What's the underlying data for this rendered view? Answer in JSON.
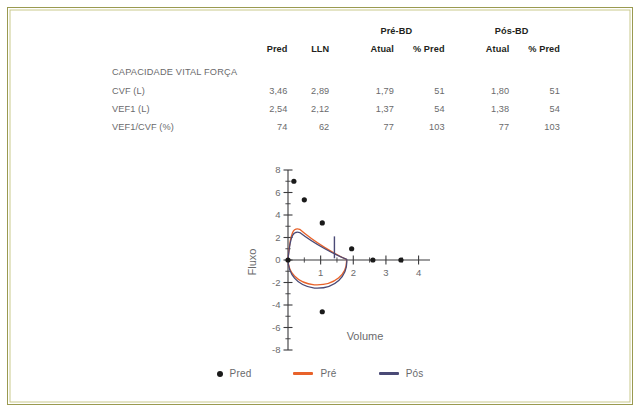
{
  "border_color": "#9a9a50",
  "table": {
    "group_headers": [
      {
        "label": "Pré-BD",
        "span": 2
      },
      {
        "label": "Pós-BD",
        "span": 2
      }
    ],
    "columns": [
      "Pred",
      "LLN",
      "Atual",
      "% Pred",
      "Atual",
      "% Pred"
    ],
    "section_label": "CAPACIDADE VITAL FORÇA",
    "rows": [
      {
        "label": "CVF (L)",
        "pred": "3,46",
        "lln": "2,89",
        "pre_atual": "1,79",
        "pre_pct": "51",
        "pos_atual": "1,80",
        "pos_pct": "51"
      },
      {
        "label": "VEF1 (L)",
        "pred": "2,54",
        "lln": "2,12",
        "pre_atual": "1,37",
        "pre_pct": "54",
        "pos_atual": "1,38",
        "pos_pct": "54"
      },
      {
        "label": "VEF1/CVF (%)",
        "pred": "74",
        "lln": "62",
        "pre_atual": "77",
        "pre_pct": "103",
        "pos_atual": "77",
        "pos_pct": "103"
      }
    ]
  },
  "chart_data": {
    "type": "line",
    "title": "",
    "xlabel": "Volume",
    "ylabel": "Fluxo",
    "xlim": [
      0,
      4.35
    ],
    "ylim": [
      -8,
      8
    ],
    "xticks": [
      1,
      2,
      3,
      4
    ],
    "yticks": [
      -8,
      -6,
      -4,
      -2,
      0,
      2,
      4,
      6,
      8
    ],
    "x_minor_step": 0.5,
    "y_minor_step": 1,
    "grid": false,
    "legend_position": "bottom",
    "series": [
      {
        "name": "Pred",
        "type": "scatter",
        "color": "#1a1a1a",
        "points": [
          {
            "x": 0.0,
            "y": 0.0
          },
          {
            "x": 0.18,
            "y": 7.0
          },
          {
            "x": 0.5,
            "y": 5.35
          },
          {
            "x": 1.05,
            "y": 3.3
          },
          {
            "x": 1.95,
            "y": 1.0
          },
          {
            "x": 2.6,
            "y": 0.0
          },
          {
            "x": 3.46,
            "y": 0.0
          },
          {
            "x": 1.05,
            "y": -4.6
          }
        ]
      },
      {
        "name": "Pré",
        "type": "loop",
        "color": "#e8622a",
        "peak_flow": 2.9,
        "volume_max": 1.79,
        "min_flow": -2.3
      },
      {
        "name": "Pós",
        "type": "loop",
        "color": "#4a4a76",
        "peak_flow": 2.6,
        "volume_max": 1.8,
        "min_flow": -2.6
      }
    ]
  },
  "legend": {
    "items": [
      {
        "label": "Pred",
        "marker": "dot",
        "color": "#1a1a1a"
      },
      {
        "label": "Pré",
        "marker": "line",
        "color": "#e8622a"
      },
      {
        "label": "Pós",
        "marker": "line",
        "color": "#4a4a76"
      }
    ]
  }
}
